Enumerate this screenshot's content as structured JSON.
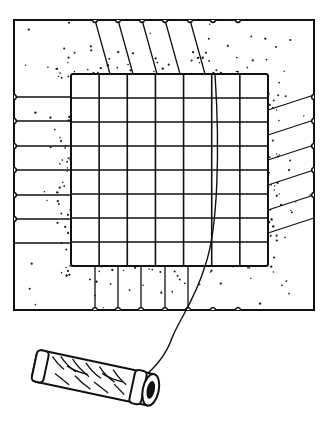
{
  "illustration": {
    "subject": "thread-winding-card-with-spool",
    "colors": {
      "ink": "#111111",
      "paper": "#ffffff",
      "stipple": "#1a1a1a"
    },
    "card": {
      "x": 14,
      "y": 20,
      "w": 134,
      "h": 136
    },
    "grid": {
      "x": 71,
      "y": 74,
      "w": 197,
      "h": 192,
      "cols": 7,
      "rows": 8
    },
    "notches": {
      "top_count": 7,
      "bottom_count": 7,
      "left_count": 6,
      "right_count": 5
    },
    "spool": {
      "cx": 95,
      "cy": 378,
      "length": 128,
      "angle_deg": 12
    }
  }
}
